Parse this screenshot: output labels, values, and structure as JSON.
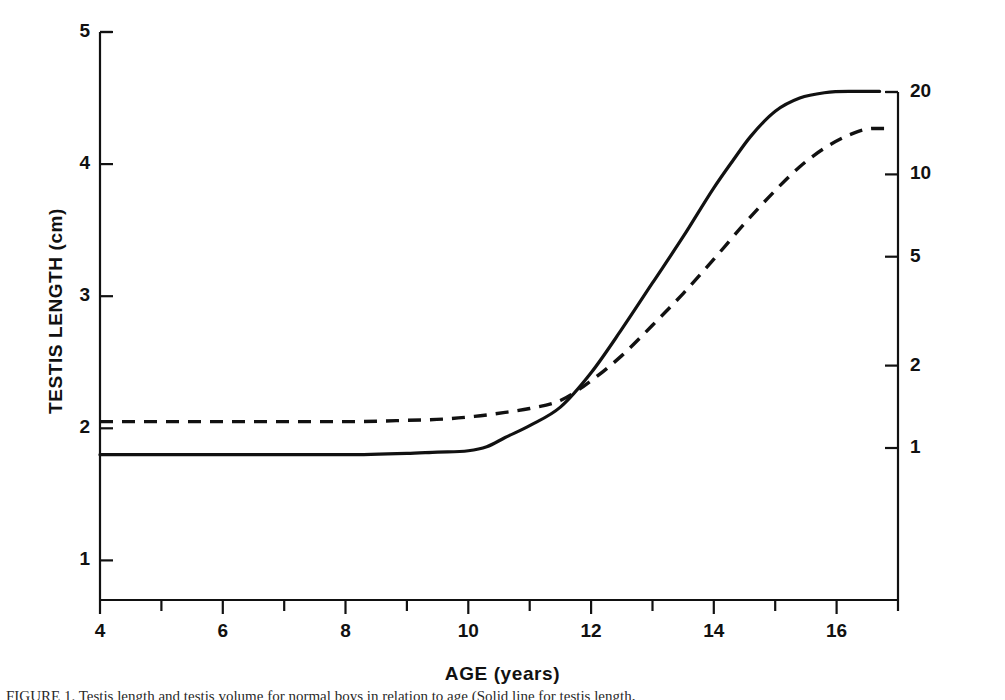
{
  "figure": {
    "background_color": "#ffffff",
    "line_color": "#111111",
    "caption_partial": "FIGURE 1. Testis length and testis volume for normal boys in relation to age (Solid line for testis length,"
  },
  "chart_data": {
    "type": "line",
    "title": "",
    "xlabel": "AGE (years)",
    "ylabel": "TESTIS LENGTH (cm)",
    "ylabel_right": "TESTIS VOLUME (cc)",
    "xlim": [
      4,
      17
    ],
    "ylim": [
      0.7,
      5.0
    ],
    "ylim_right": [
      0.75,
      20.5
    ],
    "y_right_scale": "log",
    "grid": false,
    "legend": "none",
    "xticks": [
      4,
      6,
      8,
      10,
      12,
      14,
      16
    ],
    "xticks_minor": [
      5,
      7,
      9,
      11,
      13,
      15,
      17
    ],
    "yticks_left": [
      1,
      2,
      3,
      4,
      5
    ],
    "yticks_right": [
      1,
      2,
      5,
      10,
      20
    ],
    "series": [
      {
        "name": "Testis length",
        "style": "solid",
        "axis": "left",
        "units": "cm",
        "x": [
          4.0,
          5.0,
          6.0,
          7.0,
          8.0,
          9.0,
          9.5,
          10.0,
          10.3,
          10.6,
          11.0,
          11.5,
          12.0,
          12.5,
          13.0,
          13.5,
          14.0,
          14.3,
          14.6,
          15.0,
          15.4,
          15.8,
          16.2,
          16.7
        ],
        "y": [
          1.8,
          1.8,
          1.8,
          1.8,
          1.8,
          1.81,
          1.82,
          1.83,
          1.86,
          1.93,
          2.02,
          2.16,
          2.42,
          2.75,
          3.1,
          3.45,
          3.82,
          4.02,
          4.21,
          4.4,
          4.5,
          4.54,
          4.55,
          4.55
        ]
      },
      {
        "name": "Testis volume",
        "style": "dashed",
        "axis": "right",
        "units": "cc",
        "x": [
          4.0,
          5.0,
          6.0,
          7.0,
          8.0,
          9.0,
          9.6,
          10.1,
          10.6,
          11.0,
          11.5,
          12.0,
          12.5,
          13.0,
          13.5,
          14.0,
          14.5,
          15.0,
          15.4,
          15.8,
          16.2,
          16.6,
          16.8
        ],
        "y_left_equivalent": [
          2.05,
          2.05,
          2.05,
          2.05,
          2.05,
          2.06,
          2.07,
          2.09,
          2.12,
          2.15,
          2.21,
          2.36,
          2.55,
          2.78,
          3.02,
          3.28,
          3.55,
          3.8,
          3.98,
          4.12,
          4.22,
          4.27,
          4.27
        ],
        "y_volume_cc": [
          1.6,
          1.6,
          1.6,
          1.6,
          1.6,
          1.6,
          1.6,
          1.7,
          1.7,
          1.8,
          1.9,
          2.2,
          2.7,
          3.4,
          4.3,
          5.6,
          7.3,
          9.5,
          11.4,
          13.3,
          14.9,
          16.0,
          16.0
        ]
      }
    ],
    "annotations": []
  },
  "axes": {
    "left": {
      "title": "TESTIS LENGTH (cm)",
      "ticks": [
        {
          "label": "5",
          "value": 5
        },
        {
          "label": "4",
          "value": 4
        },
        {
          "label": "3",
          "value": 3
        },
        {
          "label": "2",
          "value": 2
        },
        {
          "label": "1",
          "value": 1
        }
      ]
    },
    "right": {
      "title": "TESTIS VOLUME (cc)",
      "ticks": [
        {
          "label": "20",
          "value": 20
        },
        {
          "label": "10",
          "value": 10
        },
        {
          "label": "5",
          "value": 5
        },
        {
          "label": "2",
          "value": 2
        },
        {
          "label": "1",
          "value": 1
        }
      ]
    },
    "bottom": {
      "title": "AGE (years)",
      "ticks": [
        {
          "label": "4",
          "value": 4
        },
        {
          "label": "6",
          "value": 6
        },
        {
          "label": "8",
          "value": 8
        },
        {
          "label": "10",
          "value": 10
        },
        {
          "label": "12",
          "value": 12
        },
        {
          "label": "14",
          "value": 14
        },
        {
          "label": "16",
          "value": 16
        }
      ]
    }
  }
}
